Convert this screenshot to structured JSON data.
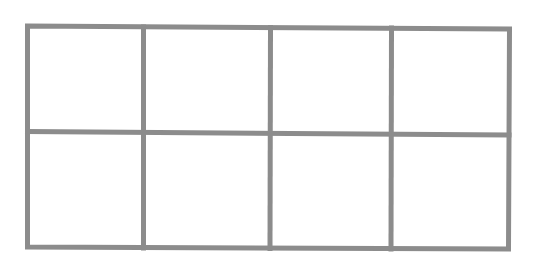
{
  "diagram": {
    "type": "grid",
    "rows": 2,
    "columns": 4,
    "line_color": "#8c8c8c",
    "background": "#ffffff",
    "line_width": 5
  }
}
